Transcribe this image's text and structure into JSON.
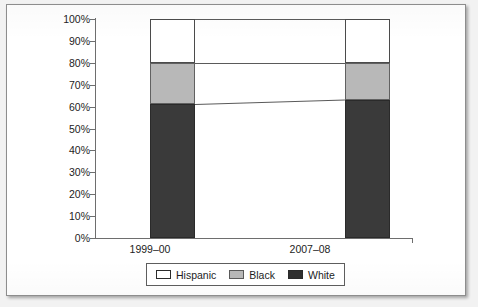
{
  "chart_data": {
    "type": "bar",
    "subtype": "100% stacked bar",
    "title": "",
    "xlabel": "",
    "ylabel": "",
    "categories": [
      "1999–00",
      "2007–08"
    ],
    "series": [
      {
        "name": "White",
        "values": [
          61,
          63
        ],
        "color": "#3a3a3a"
      },
      {
        "name": "Black",
        "values": [
          19,
          17
        ],
        "color": "#b8b8b8"
      },
      {
        "name": "Hispanic",
        "values": [
          20,
          20
        ],
        "color": "#ffffff"
      }
    ],
    "stack_order_bottom_to_top": [
      "White",
      "Black",
      "Hispanic"
    ],
    "ylim": [
      0,
      100
    ],
    "ytick_labels": [
      "0%",
      "10%",
      "20%",
      "30%",
      "40%",
      "50%",
      "60%",
      "70%",
      "80%",
      "90%",
      "100%"
    ],
    "ytick_values": [
      0,
      10,
      20,
      30,
      40,
      50,
      60,
      70,
      80,
      90,
      100
    ],
    "grid": false,
    "legend_position": "bottom",
    "connectors": [
      {
        "between": [
          "White",
          "Black"
        ],
        "from_pct": 61,
        "to_pct": 63
      },
      {
        "between": [
          "Black",
          "Hispanic"
        ],
        "from_pct": 80,
        "to_pct": 80
      },
      {
        "between": [
          "Hispanic",
          "top"
        ],
        "from_pct": 100,
        "to_pct": 100
      }
    ]
  },
  "axis": {
    "ticks": [
      {
        "label": "100%"
      },
      {
        "label": "90%"
      },
      {
        "label": "80%"
      },
      {
        "label": "70%"
      },
      {
        "label": "60%"
      },
      {
        "label": "50%"
      },
      {
        "label": "40%"
      },
      {
        "label": "30%"
      },
      {
        "label": "20%"
      },
      {
        "label": "10%"
      },
      {
        "label": "0%"
      }
    ],
    "categories": [
      {
        "label": "1999–00"
      },
      {
        "label": "2007–08"
      }
    ]
  },
  "legend": {
    "items": [
      {
        "label": "Hispanic",
        "color": "#ffffff"
      },
      {
        "label": "Black",
        "color": "#b8b8b8"
      },
      {
        "label": "White",
        "color": "#3a3a3a"
      }
    ]
  }
}
